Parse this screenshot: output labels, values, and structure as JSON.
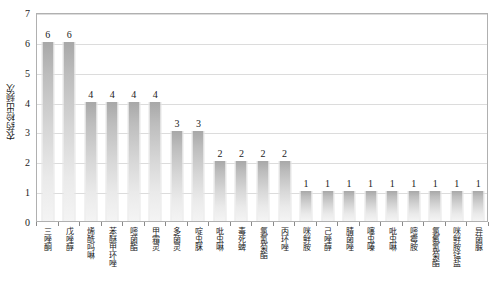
{
  "chart_data": {
    "type": "bar",
    "title": "",
    "xlabel": "",
    "ylabel": "农药检出频次",
    "ylim": [
      0,
      7
    ],
    "ytick_labels": [
      "0",
      "1",
      "2",
      "3",
      "4",
      "5",
      "6",
      "7"
    ],
    "grid": true,
    "legend": "none",
    "categories": [
      "三唑酮",
      "戊唑醇",
      "烯酰吗啉",
      "苯醚甲环唑",
      "嘧菌酯",
      "甲霜灵",
      "多菌灵",
      "啶虫脒",
      "吡虫啉",
      "毒死蜱",
      "氯氰菊酯",
      "丙环唑",
      "咪鲜胺",
      "己唑醇",
      "腈菌唑",
      "噻虫嗪",
      "吡虫啉",
      "嘧霉胺",
      "氯氟氰菊酯",
      "咪鲜胺锰盐",
      "异菌脲"
    ],
    "values": [
      6,
      6,
      4,
      4,
      4,
      4,
      3,
      3,
      2,
      2,
      2,
      2,
      1,
      1,
      1,
      1,
      1,
      1,
      1,
      1,
      1
    ],
    "value_labels": [
      "6",
      "6",
      "4",
      "4",
      "4",
      "4",
      "3",
      "3",
      "2",
      "2",
      "2",
      "2",
      "1",
      "1",
      "1",
      "1",
      "1",
      "1",
      "1",
      "1",
      "1"
    ],
    "colors": {
      "bar_top": "#a8a8a8",
      "bar_bottom": "#f4f4f4",
      "gridline": "#dcdcdc",
      "axis": "#b0b0b0",
      "text": "#1a1a1a",
      "background": "#ffffff"
    }
  }
}
